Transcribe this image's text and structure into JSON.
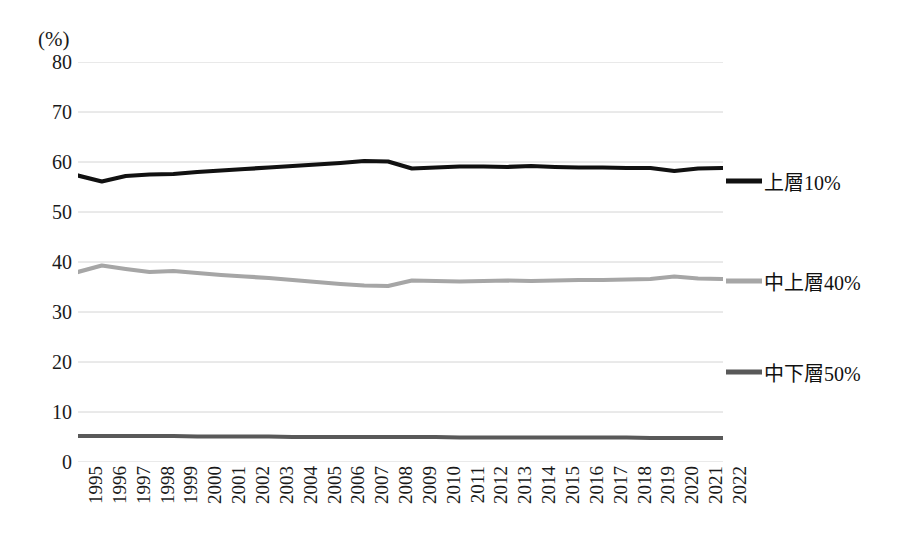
{
  "chart_data": {
    "type": "line",
    "title": "",
    "subtitle": "",
    "unit_caption": "(%)",
    "xlabel": "",
    "ylabel": "",
    "ylim": [
      0,
      80
    ],
    "ytick_step": 10,
    "yticks": [
      "80",
      "70",
      "60",
      "50",
      "40",
      "30",
      "20",
      "10",
      "0"
    ],
    "grid": true,
    "grid_axis": "y",
    "legend_position": "right",
    "xtick_rotation_deg": 90,
    "categories": [
      "1995",
      "1996",
      "1997",
      "1998",
      "1999",
      "2000",
      "2001",
      "2002",
      "2003",
      "2004",
      "2005",
      "2006",
      "2007",
      "2008",
      "2009",
      "2010",
      "2011",
      "2012",
      "2013",
      "2014",
      "2015",
      "2016",
      "2017",
      "2018",
      "2019",
      "2020",
      "2021",
      "2022"
    ],
    "series": [
      {
        "name": "上層10%",
        "color": "#111111",
        "width": 4.2,
        "values": [
          57.3,
          56.1,
          57.2,
          57.5,
          57.6,
          58.0,
          58.3,
          58.6,
          58.9,
          59.2,
          59.5,
          59.8,
          60.2,
          60.1,
          58.7,
          58.9,
          59.1,
          59.1,
          59.0,
          59.2,
          59.0,
          58.9,
          58.9,
          58.8,
          58.8,
          58.2,
          58.7,
          58.8
        ]
      },
      {
        "name": "中上層40%",
        "color": "#a6a6a6",
        "width": 4.2,
        "values": [
          38.0,
          39.3,
          38.6,
          38.0,
          38.2,
          37.8,
          37.4,
          37.1,
          36.8,
          36.4,
          36.0,
          35.6,
          35.3,
          35.2,
          36.3,
          36.2,
          36.1,
          36.2,
          36.3,
          36.2,
          36.3,
          36.4,
          36.4,
          36.5,
          36.6,
          37.1,
          36.7,
          36.6
        ]
      },
      {
        "name": "中下層50%",
        "color": "#595959",
        "width": 4.2,
        "values": [
          5.2,
          5.2,
          5.2,
          5.2,
          5.2,
          5.1,
          5.1,
          5.1,
          5.1,
          5.0,
          5.0,
          5.0,
          5.0,
          5.0,
          5.0,
          5.0,
          4.9,
          4.9,
          4.9,
          4.9,
          4.9,
          4.9,
          4.9,
          4.9,
          4.8,
          4.8,
          4.8,
          4.8
        ]
      }
    ],
    "legend": [
      {
        "label": "上層10%",
        "color": "#111111",
        "marker_y": 181,
        "thickness": 5
      },
      {
        "label": "中上層40%",
        "color": "#a6a6a6",
        "marker_y": 281,
        "thickness": 5
      },
      {
        "label": "中下層50%",
        "color": "#595959",
        "marker_y": 372,
        "thickness": 5
      }
    ]
  }
}
